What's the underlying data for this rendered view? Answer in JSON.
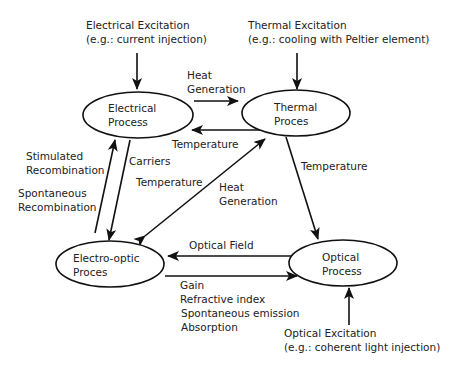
{
  "diagram": {
    "nodes": {
      "electrical": {
        "line1": "Electrical",
        "line2": "Process"
      },
      "thermal": {
        "line1": "Thermal",
        "line2": "Proces"
      },
      "electro_optic": {
        "line1": "Electro-optic",
        "line2": "Proces"
      },
      "optical": {
        "line1": "Optical",
        "line2": "Process"
      }
    },
    "inputs": {
      "electrical_excitation": {
        "line1": "Electrical Excitation",
        "line2": "(e.g.: current injection)"
      },
      "thermal_excitation": {
        "line1": "Thermal Excitation",
        "line2": "(e.g.: cooling with Peltier element)"
      },
      "optical_excitation": {
        "line1": "Optical Excitation",
        "line2": "(e.g.: coherent light injection)"
      }
    },
    "edges": {
      "electrical_to_thermal": {
        "line1": "Heat",
        "line2": "Generation"
      },
      "thermal_to_electrical": {
        "line1": "Temperature"
      },
      "electrical_to_electro_optic": {
        "line1": "Carriers"
      },
      "electro_optic_to_electrical": {
        "line1": "Stimulated",
        "line2": "Recombination",
        "line3": "Spontaneous",
        "line4": "Recombination"
      },
      "thermal_to_electro_optic": {
        "line1": "Temperature"
      },
      "electro_optic_to_thermal": {
        "line1": "Heat",
        "line2": "Generation"
      },
      "thermal_to_optical": {
        "line1": "Temperature"
      },
      "optical_to_electro_optic": {
        "line1": "Optical Field"
      },
      "electro_optic_to_optical": {
        "line1": "Gain",
        "line2": "Refractive index",
        "line3": "Spontaneous emission",
        "line4": "Absorption"
      }
    },
    "colors": {
      "stroke": "#111111",
      "text": "#222222",
      "background": "#ffffff"
    }
  }
}
